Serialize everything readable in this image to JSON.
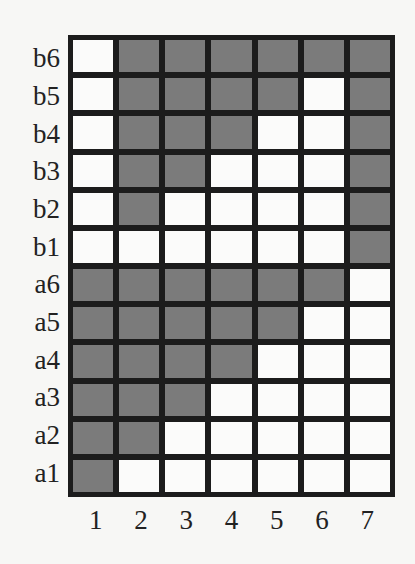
{
  "diagram": {
    "type": "binary-grid",
    "colors": {
      "filled": "#7b7b7b",
      "empty": "#fbfbfa",
      "border": "#1c1c1c"
    },
    "row_labels": [
      "b6",
      "b5",
      "b4",
      "b3",
      "b2",
      "b1",
      "a6",
      "a5",
      "a4",
      "a3",
      "a2",
      "a1"
    ],
    "col_labels": [
      "1",
      "2",
      "3",
      "4",
      "5",
      "6",
      "7"
    ],
    "cells": [
      [
        0,
        1,
        1,
        1,
        1,
        1,
        1
      ],
      [
        0,
        1,
        1,
        1,
        1,
        0,
        1
      ],
      [
        0,
        1,
        1,
        1,
        0,
        0,
        1
      ],
      [
        0,
        1,
        1,
        0,
        0,
        0,
        1
      ],
      [
        0,
        1,
        0,
        0,
        0,
        0,
        1
      ],
      [
        0,
        0,
        0,
        0,
        0,
        0,
        1
      ],
      [
        1,
        1,
        1,
        1,
        1,
        1,
        0
      ],
      [
        1,
        1,
        1,
        1,
        1,
        0,
        0
      ],
      [
        1,
        1,
        1,
        1,
        0,
        0,
        0
      ],
      [
        1,
        1,
        1,
        0,
        0,
        0,
        0
      ],
      [
        1,
        1,
        0,
        0,
        0,
        0,
        0
      ],
      [
        1,
        0,
        0,
        0,
        0,
        0,
        0
      ]
    ]
  }
}
